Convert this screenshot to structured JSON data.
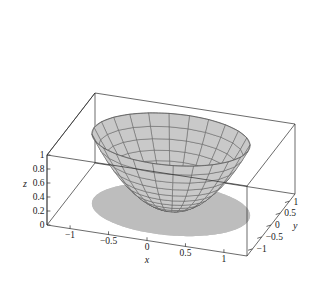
{
  "figure": {
    "kind": "surface-plot-3d",
    "background_color": "#ffffff",
    "width": 320,
    "height": 285
  },
  "chart_data": {
    "type": "surface",
    "title": "",
    "subtitle": "",
    "xlabel": "x",
    "ylabel": "y",
    "zlabel": "z",
    "surface_equation": "z = x^2 + y^2",
    "surface_domain": "x^2 + y^2 <= 1",
    "mesh": {
      "style": "polar",
      "radial_divisions": 24,
      "circular_divisions": 12,
      "line_color": "#565656",
      "fill_color": "#c9c9c9"
    },
    "shadow": {
      "description": "gray cylindrical projection of the unit disk below the surface",
      "fill_color": "#bdbdbd",
      "top_color": "#c4c4c4"
    },
    "xlim": [
      -1.3,
      1.3
    ],
    "ylim": [
      -1.3,
      1.3
    ],
    "zlim": [
      0,
      1
    ],
    "xticks": [
      "-1",
      "-0.5",
      "0",
      "0.5",
      "1"
    ],
    "xtick_values": [
      -1,
      -0.5,
      0,
      0.5,
      1
    ],
    "yticks": [
      "1",
      "0.5",
      "0",
      "-0.5",
      "-1"
    ],
    "ytick_values": [
      1,
      0.5,
      0,
      -0.5,
      -1
    ],
    "zticks": [
      "0",
      "0.2",
      "0.4",
      "0.6",
      "0.8",
      "1"
    ],
    "ztick_values": [
      0,
      0.2,
      0.4,
      0.6,
      0.8,
      1
    ],
    "grid": false,
    "legend": null,
    "box": true,
    "box_color": "#2b2b2b"
  },
  "axes": {
    "x": {
      "label": "x",
      "ticks": [
        {
          "value": -1,
          "text": "-1"
        },
        {
          "value": -0.5,
          "text": "-0.5"
        },
        {
          "value": 0,
          "text": "0"
        },
        {
          "value": 0.5,
          "text": "0.5"
        },
        {
          "value": 1,
          "text": "1"
        }
      ]
    },
    "y": {
      "label": "y",
      "ticks": [
        {
          "value": 1,
          "text": "1"
        },
        {
          "value": 0.5,
          "text": "0.5"
        },
        {
          "value": 0,
          "text": "0"
        },
        {
          "value": -0.5,
          "text": "-0.5"
        },
        {
          "value": -1,
          "text": "-1"
        }
      ]
    },
    "z": {
      "label": "z",
      "ticks": [
        {
          "value": 1,
          "text": "1"
        },
        {
          "value": 0.8,
          "text": "0.8"
        },
        {
          "value": 0.6,
          "text": "0.6"
        },
        {
          "value": 0.4,
          "text": "0.4"
        },
        {
          "value": 0.2,
          "text": "0.2"
        },
        {
          "value": 0,
          "text": "0"
        }
      ]
    }
  }
}
